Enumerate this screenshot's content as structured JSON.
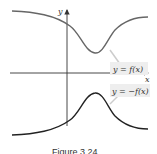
{
  "figure": {
    "caption": "Figure 3.24",
    "axes": {
      "x_label": "x",
      "y_label": "y"
    },
    "curves": [
      {
        "name": "f",
        "label": "y = f(x)",
        "color": "#555555"
      },
      {
        "name": "neg-f",
        "label": "y = −f(x)",
        "color": "#222222"
      }
    ],
    "label_box_color": "#eeeeee"
  }
}
